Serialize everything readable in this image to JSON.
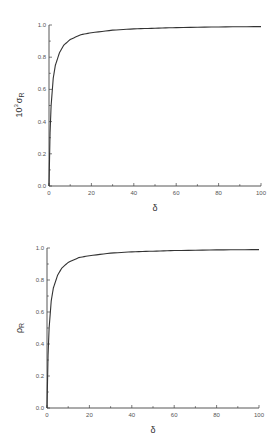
{
  "chart_data": [
    {
      "type": "line",
      "title": "",
      "xlabel": "δ",
      "ylabel": "10^3 σR",
      "ylabel_parts": {
        "prefix": "10",
        "exponent": "3",
        "symbol": "σ",
        "subscript": "R"
      },
      "xlim": [
        0,
        100
      ],
      "ylim": [
        0.0,
        1.0
      ],
      "x_ticks": [
        "0",
        "20",
        "40",
        "60",
        "80",
        "100"
      ],
      "y_ticks": [
        "0.0",
        "0.2",
        "0.4",
        "0.6",
        "0.8",
        "1.0"
      ],
      "grid": false,
      "legend": null,
      "series": [
        {
          "name": "10^3 σR",
          "x": [
            0,
            0.5,
            1,
            2,
            3,
            5,
            7,
            10,
            15,
            20,
            30,
            40,
            50,
            60,
            80,
            100
          ],
          "y": [
            0.0,
            0.33,
            0.5,
            0.67,
            0.75,
            0.83,
            0.875,
            0.91,
            0.94,
            0.952,
            0.968,
            0.976,
            0.98,
            0.984,
            0.988,
            0.99
          ]
        }
      ]
    },
    {
      "type": "line",
      "title": "",
      "xlabel": "δ",
      "ylabel": "ρR",
      "ylabel_parts": {
        "symbol": "ρ",
        "subscript": "R"
      },
      "xlim": [
        0,
        100
      ],
      "ylim": [
        0.0,
        1.0
      ],
      "x_ticks": [
        "0",
        "20",
        "40",
        "60",
        "80",
        "100"
      ],
      "y_ticks": [
        "0.0",
        "0.2",
        "0.4",
        "0.6",
        "0.8",
        "1.0"
      ],
      "grid": false,
      "legend": null,
      "series": [
        {
          "name": "ρR",
          "x": [
            0,
            0.5,
            1,
            2,
            3,
            5,
            7,
            10,
            15,
            20,
            30,
            40,
            50,
            60,
            80,
            100
          ],
          "y": [
            0.0,
            0.33,
            0.5,
            0.67,
            0.75,
            0.83,
            0.875,
            0.91,
            0.94,
            0.952,
            0.968,
            0.976,
            0.98,
            0.984,
            0.988,
            0.99
          ]
        }
      ]
    }
  ]
}
